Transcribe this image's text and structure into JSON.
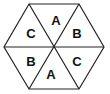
{
  "diagram": {
    "shape": "hexagon divided into 6 triangles",
    "stroke_color": "#222222",
    "fill_color": "#ffffff",
    "triangles": [
      {
        "position": "top",
        "label": "A"
      },
      {
        "position": "upper-right",
        "label": "B"
      },
      {
        "position": "lower-right",
        "label": "C"
      },
      {
        "position": "bottom",
        "label": "A"
      },
      {
        "position": "lower-left",
        "label": "B"
      },
      {
        "position": "upper-left",
        "label": "C"
      }
    ]
  }
}
